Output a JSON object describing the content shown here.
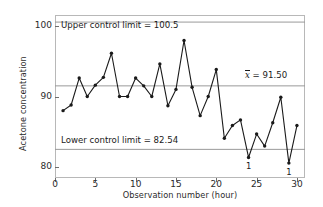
{
  "chart_data": {
    "type": "line",
    "title": "",
    "xlabel": "Observation number (hour)",
    "ylabel": "Acetone concentration",
    "xlim": [
      0,
      31
    ],
    "ylim": [
      78.5,
      101.5
    ],
    "xticks": [
      0,
      5,
      10,
      15,
      20,
      25,
      30
    ],
    "yticks": [
      80,
      90,
      100
    ],
    "grid": false,
    "legend": "none",
    "x": [
      1,
      2,
      3,
      4,
      5,
      6,
      7,
      8,
      9,
      10,
      11,
      12,
      13,
      14,
      15,
      16,
      17,
      18,
      19,
      20,
      21,
      22,
      23,
      24,
      25,
      26,
      27,
      28,
      29,
      30
    ],
    "values": [
      88.0,
      88.8,
      92.6,
      90.0,
      91.6,
      92.7,
      96.1,
      90.0,
      90.0,
      92.6,
      91.5,
      90.0,
      94.6,
      88.7,
      91.0,
      97.9,
      91.3,
      87.3,
      90.0,
      93.8,
      84.1,
      85.9,
      86.7,
      81.4,
      84.7,
      83.0,
      86.3,
      89.9,
      80.6,
      85.9
    ],
    "control_lines": [
      {
        "name": "upper-control-limit",
        "label": "Upper control limit = 100.5",
        "value": 100.5
      },
      {
        "name": "center-line",
        "label": "x̄ = 91.50",
        "label_prefix": "x",
        "label_suffix": " = 91.50",
        "value": 91.5
      },
      {
        "name": "lower-control-limit",
        "label": "Lower control limit = 82.54",
        "value": 82.54
      }
    ],
    "violations": [
      {
        "observation": 24,
        "value": 81.4,
        "label": "1"
      },
      {
        "observation": 29,
        "value": 80.6,
        "label": "1"
      }
    ],
    "colors": {
      "series_line": "#1a1a1a",
      "marker": "#1a1a1a",
      "control_line": "#9a9a9a",
      "frame": "#b8b8b8",
      "text": "#1a1a1a",
      "background": "#ffffff"
    }
  }
}
